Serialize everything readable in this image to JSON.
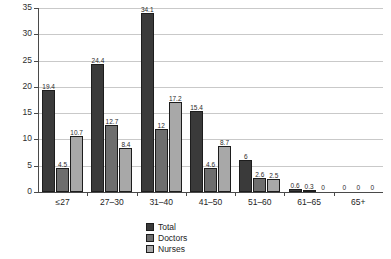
{
  "chart_data": {
    "type": "bar",
    "title": "",
    "xlabel": "",
    "ylabel": "",
    "ylim": [
      0,
      35
    ],
    "ytick_step": 5,
    "yticks": [
      0,
      5,
      10,
      15,
      20,
      25,
      30,
      35
    ],
    "grid": true,
    "legend_position": "bottom-center",
    "categories": [
      "≤27",
      "27–30",
      "31–40",
      "41–50",
      "51–60",
      "61–65",
      "65+"
    ],
    "series": [
      {
        "name": "Total",
        "color": "#3a3a3a",
        "values": [
          19.4,
          24.4,
          34.1,
          15.4,
          6,
          0.6,
          0
        ],
        "labels": [
          "19.4",
          "24.4",
          "34.1",
          "15.4",
          "6",
          "0.6",
          "0"
        ]
      },
      {
        "name": "Doctors",
        "color": "#6e6e6e",
        "values": [
          4.5,
          12.7,
          12,
          4.6,
          2.6,
          0.3,
          0
        ],
        "labels": [
          "4.5",
          "12.7",
          "12",
          "4.6",
          "2.6",
          "0.3",
          "0"
        ]
      },
      {
        "name": "Nurses",
        "color": "#a8a8a8",
        "values": [
          10.7,
          8.4,
          17.2,
          8.7,
          2.5,
          0,
          0
        ],
        "labels": [
          "10.7",
          "8.4",
          "17.2",
          "8.7",
          "2.5",
          "0",
          "0"
        ]
      }
    ]
  },
  "legend": {
    "items": [
      {
        "label": "Total"
      },
      {
        "label": "Doctors"
      },
      {
        "label": "Nurses"
      }
    ]
  }
}
